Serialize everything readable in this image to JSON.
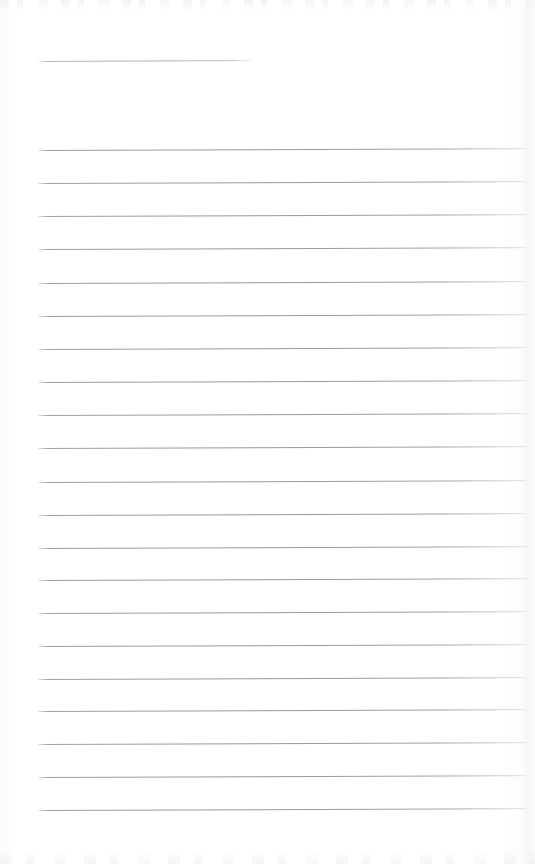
{
  "document": {
    "kind": "scanned-ruled-notebook-page",
    "title": "Blank Ruled Page",
    "page_width": 535,
    "page_height": 864,
    "background_color": "#fefefe",
    "text_content": "",
    "visible_text_lines": []
  },
  "header_rule": {
    "name": "header-rule",
    "x": 38,
    "y": 61,
    "width": 216,
    "color": "#aaaab3",
    "thickness": 1,
    "slant_deg": -0.25
  },
  "ruling": {
    "name": "ruled-lines",
    "color": "#91919c",
    "thickness": 1,
    "left_x": 38,
    "right_x": 535,
    "spacing": 33,
    "slant_deg": -0.22,
    "count": 21,
    "line_y": [
      150,
      183,
      216,
      249,
      283,
      316,
      349,
      382,
      415,
      448,
      482,
      515,
      548,
      580,
      613,
      646,
      679,
      711,
      744,
      777,
      810
    ]
  },
  "margins": {
    "left_margin_px": 38,
    "top_margin_px": 61,
    "bottom_blank_px": 54,
    "margin_rule_visible": false
  },
  "artifacts": {
    "top_ghost_band": "scan-noise",
    "bottom_ghost_band": "scan-noise",
    "right_edge_shadow": "page-edge-shadow",
    "artifact_color": "#d6d6db"
  }
}
